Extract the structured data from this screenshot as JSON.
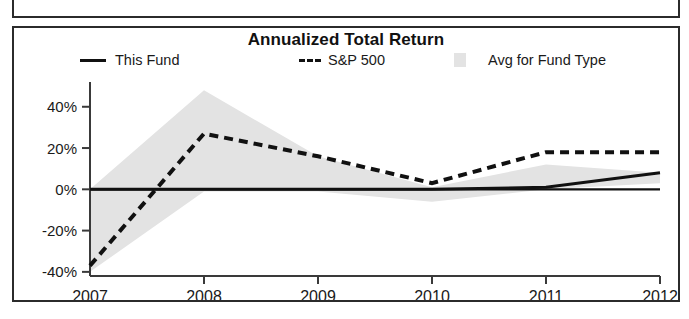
{
  "chart_data": {
    "type": "area",
    "title": "Annualized Total Return",
    "xlabel": "",
    "ylabel": "",
    "categories": [
      "2007",
      "2008",
      "2009",
      "2010",
      "2011",
      "2012"
    ],
    "x_last_suffix": "YTD",
    "ytick_labels": [
      "40%",
      "20%",
      "0%",
      "-20%",
      "-40%"
    ],
    "ytick_values": [
      40,
      20,
      0,
      -20,
      -40
    ],
    "ylim": [
      -42,
      52
    ],
    "grid": false,
    "legend_position": "top",
    "series": [
      {
        "name": "This Fund",
        "style": "solid",
        "color": "#111111",
        "values": [
          0,
          0,
          0,
          0,
          1,
          8
        ]
      },
      {
        "name": "S&P 500",
        "style": "dashed",
        "color": "#111111",
        "values": [
          -37,
          27,
          16,
          3,
          18,
          18
        ]
      },
      {
        "name": "Avg for Fund Type",
        "style": "band",
        "color": "#e3e3e3",
        "upper": [
          0,
          48,
          16,
          1,
          12,
          8
        ],
        "lower": [
          -40,
          -1,
          -1,
          -6,
          0,
          3
        ]
      }
    ]
  },
  "chart": {
    "title": "Annualized Total Return",
    "legend": [
      {
        "label": "This Fund",
        "swatch": "solid-line-swatch"
      },
      {
        "label": "S&P 500",
        "swatch": "dashed-line-swatch"
      },
      {
        "label": "Avg for Fund Type",
        "swatch": "gray-box-swatch"
      }
    ],
    "y_axis": {
      "ticks": [
        "40%",
        "20%",
        "0%",
        "-20%",
        "-40%"
      ]
    },
    "x_axis": {
      "ticks": [
        "2007",
        "2008",
        "2009",
        "2010",
        "2011",
        "2012"
      ],
      "ytd_label": "YTD"
    }
  }
}
